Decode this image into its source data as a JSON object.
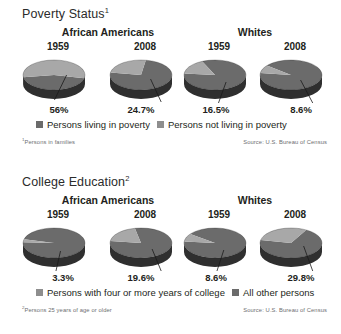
{
  "colors": {
    "top_face_dark": "#6b6b6b",
    "top_face_light": "#a8a8a8",
    "side_dark": "#2f2f2f",
    "side_light": "#5a5a5a",
    "edge": "#1a1a1a",
    "text": "#231f20",
    "muted": "#6d6e71",
    "leader_line": "#1a1a1a"
  },
  "panels": [
    {
      "id": "poverty",
      "title": "Poverty Status",
      "title_sup": "1",
      "groups": [
        {
          "id": "african-americans",
          "label": "African Americans"
        },
        {
          "id": "whites",
          "label": "Whites"
        }
      ],
      "charts": [
        {
          "group": "african-americans",
          "year": "1959",
          "pct_label": "56%",
          "value": 56.0,
          "highlight_start_deg": 171,
          "leader_from": [
            0.6,
            0.46
          ],
          "leader_to": [
            0.44,
            0.96
          ]
        },
        {
          "group": "african-americans",
          "year": "2008",
          "pct_label": "24.7%",
          "value": 24.7,
          "highlight_start_deg": 190,
          "leader_from": [
            0.56,
            0.54
          ],
          "leader_to": [
            0.7,
            1.0
          ]
        },
        {
          "group": "whites",
          "year": "1959",
          "pct_label": "16.5%",
          "value": 16.5,
          "highlight_start_deg": 186,
          "leader_from": [
            0.58,
            0.6
          ],
          "leader_to": [
            0.48,
            1.02
          ]
        },
        {
          "group": "whites",
          "year": "2008",
          "pct_label": "8.6%",
          "value": 8.6,
          "highlight_start_deg": 188,
          "leader_from": [
            0.56,
            0.56
          ],
          "leader_to": [
            0.72,
            1.02
          ]
        }
      ],
      "legend": [
        {
          "swatch": "#6b6b6b",
          "label": "Persons living in poverty"
        },
        {
          "swatch": "#8e8e8e",
          "label": "Persons not living in poverty"
        }
      ],
      "footnote": "Persons in families",
      "footnote_sup": "1",
      "source": "Source: U.S. Bureau of Census"
    },
    {
      "id": "college",
      "title": "College Education",
      "title_sup": "2",
      "groups": [
        {
          "id": "african-americans",
          "label": "African Americans"
        },
        {
          "id": "whites",
          "label": "Whites"
        }
      ],
      "charts": [
        {
          "group": "african-americans",
          "year": "1959",
          "pct_label": "3.3%",
          "value": 3.3,
          "highlight_start_deg": 183,
          "leader_from": [
            0.52,
            0.62
          ],
          "leader_to": [
            0.46,
            1.02
          ]
        },
        {
          "group": "african-americans",
          "year": "2008",
          "pct_label": "19.6%",
          "value": 19.6,
          "highlight_start_deg": 188,
          "leader_from": [
            0.58,
            0.58
          ],
          "leader_to": [
            0.7,
            1.02
          ]
        },
        {
          "group": "whites",
          "year": "1959",
          "pct_label": "8.6%",
          "value": 8.6,
          "highlight_start_deg": 186,
          "leader_from": [
            0.55,
            0.6
          ],
          "leader_to": [
            0.46,
            1.02
          ]
        },
        {
          "group": "whites",
          "year": "2008",
          "pct_label": "29.8%",
          "value": 29.8,
          "highlight_start_deg": 192,
          "leader_from": [
            0.6,
            0.52
          ],
          "leader_to": [
            0.72,
            1.02
          ]
        }
      ],
      "legend": [
        {
          "swatch": "#8e8e8e",
          "label": "Persons with four or more years of college"
        },
        {
          "swatch": "#6b6b6b",
          "label": "All other persons"
        }
      ],
      "footnote": "Persons 25 years of age or older",
      "footnote_sup": "2",
      "source": "Source: U.S. Bureau of Census"
    }
  ],
  "chart_data": [
    {
      "type": "pie",
      "title": "Poverty Status",
      "note": "Persons in families",
      "source": "Source: U.S. Bureau of Census",
      "legend": [
        "Persons living in poverty",
        "Persons not living in poverty"
      ],
      "legend_position": "below",
      "series": [
        {
          "name": "African Americans 1959",
          "categories": [
            "Persons living in poverty",
            "Persons not living in poverty"
          ],
          "values": [
            56.0,
            44.0
          ],
          "labels": [
            "56%",
            ""
          ]
        },
        {
          "name": "African Americans 2008",
          "categories": [
            "Persons living in poverty",
            "Persons not living in poverty"
          ],
          "values": [
            24.7,
            75.3
          ],
          "labels": [
            "24.7%",
            ""
          ]
        },
        {
          "name": "Whites 1959",
          "categories": [
            "Persons living in poverty",
            "Persons not living in poverty"
          ],
          "values": [
            16.5,
            83.5
          ],
          "labels": [
            "16.5%",
            ""
          ]
        },
        {
          "name": "Whites 2008",
          "categories": [
            "Persons living in poverty",
            "Persons not living in poverty"
          ],
          "values": [
            8.6,
            91.4
          ],
          "labels": [
            "8.6%",
            ""
          ]
        }
      ]
    },
    {
      "type": "pie",
      "title": "College Education",
      "note": "Persons 25 years of age or older",
      "source": "Source: U.S. Bureau of Census",
      "legend": [
        "Persons with four or more years of college",
        "All other persons"
      ],
      "legend_position": "below",
      "series": [
        {
          "name": "African Americans 1959",
          "categories": [
            "Persons with four or more years of college",
            "All other persons"
          ],
          "values": [
            3.3,
            96.7
          ],
          "labels": [
            "3.3%",
            ""
          ]
        },
        {
          "name": "African Americans 2008",
          "categories": [
            "Persons with four or more years of college",
            "All other persons"
          ],
          "values": [
            19.6,
            80.4
          ],
          "labels": [
            "19.6%",
            ""
          ]
        },
        {
          "name": "Whites 1959",
          "categories": [
            "Persons with four or more years of college",
            "All other persons"
          ],
          "values": [
            8.6,
            91.4
          ],
          "labels": [
            "8.6%",
            ""
          ]
        },
        {
          "name": "Whites 2008",
          "categories": [
            "Persons with four or more years of college",
            "All other persons"
          ],
          "values": [
            29.8,
            70.2
          ],
          "labels": [
            "29.8%",
            ""
          ]
        }
      ]
    }
  ]
}
